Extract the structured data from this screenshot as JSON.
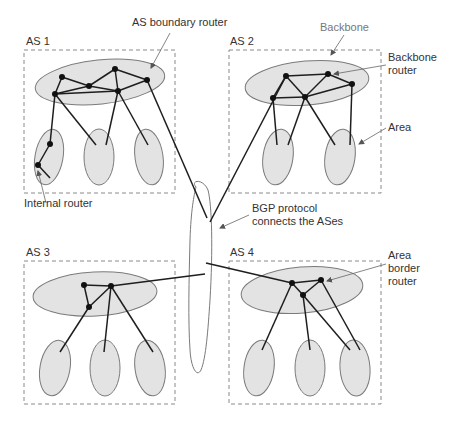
{
  "diagram": {
    "colors": {
      "region_fill": "#e3e3e3",
      "region_stroke": "#7a7a7a",
      "link": "#1e1e1e",
      "router": "#111111",
      "box_dash": "#8a8a8a",
      "label": "#333333",
      "label_light": "#777777",
      "pointer": "#666666"
    },
    "autonomous_systems": [
      {
        "id": "as1",
        "label": "AS 1",
        "box": [
          24,
          50,
          151,
          143
        ],
        "label_pos": [
          26,
          45
        ],
        "backbone": {
          "cx": 100,
          "cy": 82,
          "rx": 65,
          "ry": 22,
          "rot": -6
        },
        "areas": [
          {
            "cx": 49,
            "cy": 157,
            "rx": 14,
            "ry": 28,
            "rot": 10
          },
          {
            "cx": 99,
            "cy": 157,
            "rx": 15,
            "ry": 28,
            "rot": 0
          },
          {
            "cx": 149,
            "cy": 157,
            "rx": 14,
            "ry": 28,
            "rot": -8
          }
        ],
        "routers": [
          [
            62,
            77
          ],
          [
            55,
            94
          ],
          [
            89,
            86
          ],
          [
            115,
            69
          ],
          [
            118,
            91
          ],
          [
            147,
            80
          ],
          [
            50,
            144
          ],
          [
            38,
            165
          ]
        ],
        "links": [
          [
            62,
            77,
            55,
            94
          ],
          [
            62,
            77,
            89,
            86
          ],
          [
            89,
            86,
            115,
            69
          ],
          [
            115,
            69,
            147,
            80
          ],
          [
            55,
            94,
            89,
            86
          ],
          [
            89,
            86,
            118,
            91
          ],
          [
            55,
            94,
            118,
            91
          ],
          [
            118,
            91,
            147,
            80
          ],
          [
            115,
            69,
            118,
            91
          ],
          [
            55,
            94,
            50,
            144
          ],
          [
            50,
            144,
            38,
            165
          ],
          [
            38,
            165,
            50,
            178
          ],
          [
            55,
            94,
            96,
            145
          ],
          [
            118,
            91,
            106,
            145
          ],
          [
            118,
            91,
            148,
            145
          ]
        ]
      },
      {
        "id": "as2",
        "label": "AS 2",
        "box": [
          229,
          50,
          152,
          143
        ],
        "label_pos": [
          230,
          45
        ],
        "backbone": {
          "cx": 307,
          "cy": 83,
          "rx": 62,
          "ry": 22,
          "rot": -5
        },
        "areas": [
          {
            "cx": 278,
            "cy": 157,
            "rx": 15,
            "ry": 28,
            "rot": 8
          },
          {
            "cx": 340,
            "cy": 157,
            "rx": 15,
            "ry": 28,
            "rot": 8
          }
        ],
        "routers": [
          [
            286,
            76
          ],
          [
            328,
            74
          ],
          [
            352,
            84
          ],
          [
            273,
            98
          ],
          [
            305,
            97
          ]
        ],
        "links": [
          [
            286,
            76,
            328,
            74
          ],
          [
            328,
            74,
            352,
            84
          ],
          [
            286,
            76,
            273,
            98
          ],
          [
            286,
            76,
            305,
            97
          ],
          [
            328,
            74,
            305,
            97
          ],
          [
            273,
            98,
            305,
            97
          ],
          [
            305,
            97,
            352,
            84
          ],
          [
            273,
            98,
            277,
            145
          ],
          [
            305,
            97,
            288,
            145
          ],
          [
            305,
            97,
            335,
            145
          ],
          [
            352,
            84,
            350,
            145
          ]
        ]
      },
      {
        "id": "as3",
        "label": "AS 3",
        "box": [
          24,
          261,
          151,
          143
        ],
        "label_pos": [
          26,
          256
        ],
        "backbone": {
          "cx": 95,
          "cy": 294,
          "rx": 62,
          "ry": 22,
          "rot": -3
        },
        "areas": [
          {
            "cx": 55,
            "cy": 368,
            "rx": 15,
            "ry": 28,
            "rot": 10
          },
          {
            "cx": 105,
            "cy": 368,
            "rx": 15,
            "ry": 28,
            "rot": 0
          },
          {
            "cx": 150,
            "cy": 368,
            "rx": 15,
            "ry": 28,
            "rot": -8
          }
        ],
        "routers": [
          [
            84,
            285
          ],
          [
            111,
            286
          ],
          [
            89,
            307
          ]
        ],
        "links": [
          [
            84,
            285,
            111,
            286
          ],
          [
            84,
            285,
            89,
            307
          ],
          [
            89,
            307,
            111,
            286
          ],
          [
            89,
            307,
            60,
            352
          ],
          [
            111,
            286,
            104,
            352
          ],
          [
            111,
            286,
            153,
            352
          ]
        ]
      },
      {
        "id": "as4",
        "label": "AS 4",
        "box": [
          229,
          261,
          152,
          143
        ],
        "label_pos": [
          230,
          256
        ],
        "backbone": {
          "cx": 302,
          "cy": 290,
          "rx": 61,
          "ry": 23,
          "rot": -5
        },
        "areas": [
          {
            "cx": 259,
            "cy": 368,
            "rx": 15,
            "ry": 28,
            "rot": 8
          },
          {
            "cx": 310,
            "cy": 368,
            "rx": 15,
            "ry": 28,
            "rot": 0
          },
          {
            "cx": 355,
            "cy": 368,
            "rx": 15,
            "ry": 28,
            "rot": -4
          }
        ],
        "routers": [
          [
            292,
            283
          ],
          [
            321,
            280
          ],
          [
            303,
            295
          ]
        ],
        "links": [
          [
            292,
            283,
            321,
            280
          ],
          [
            292,
            283,
            303,
            295
          ],
          [
            303,
            295,
            321,
            280
          ],
          [
            292,
            283,
            262,
            350
          ],
          [
            303,
            295,
            310,
            350
          ],
          [
            303,
            295,
            350,
            350
          ],
          [
            321,
            280,
            360,
            350
          ]
        ]
      }
    ],
    "bgp_links": [
      [
        147,
        80,
        207,
        218
      ],
      [
        286,
        76,
        210,
        222
      ],
      [
        111,
        286,
        205,
        274
      ],
      [
        206,
        263,
        292,
        283
      ]
    ],
    "bgp_cloud_path": "M196,187 C190,180 203,178 208,190 C212,205 213,250 210,300 C208,330 206,358 201,370 C197,378 191,368 190,350 C188,320 189,280 190,240 C191,210 194,195 196,187 Z",
    "labels": [
      {
        "id": "as-boundary-router-label",
        "text": "AS boundary router",
        "x": 132,
        "y": 26,
        "cls": ""
      },
      {
        "id": "backbone-label",
        "text": "Backbone",
        "x": 320,
        "y": 31,
        "cls": "light"
      },
      {
        "id": "backbone-router-label-1",
        "text": "Backbone",
        "x": 388,
        "y": 61,
        "cls": ""
      },
      {
        "id": "backbone-router-label-2",
        "text": "router",
        "x": 388,
        "y": 74,
        "cls": ""
      },
      {
        "id": "area-label",
        "text": "Area",
        "x": 388,
        "y": 131,
        "cls": ""
      },
      {
        "id": "internal-router-label",
        "text": "Internal router",
        "x": 24,
        "y": 207,
        "cls": ""
      },
      {
        "id": "bgp-label-1",
        "text": "BGP protocol",
        "x": 252,
        "y": 212,
        "cls": ""
      },
      {
        "id": "bgp-label-2",
        "text": "connects the ASes",
        "x": 252,
        "y": 225,
        "cls": ""
      },
      {
        "id": "area-border-router-label-1",
        "text": "Area",
        "x": 388,
        "y": 259,
        "cls": ""
      },
      {
        "id": "area-border-router-label-2",
        "text": "border",
        "x": 388,
        "y": 272,
        "cls": ""
      },
      {
        "id": "area-border-router-label-3",
        "text": "router",
        "x": 388,
        "y": 285,
        "cls": ""
      }
    ],
    "pointers": [
      [
        170,
        33,
        151,
        68
      ],
      [
        344,
        35,
        331,
        55
      ],
      [
        386,
        65,
        334,
        74
      ],
      [
        386,
        128,
        359,
        144
      ],
      [
        46,
        203,
        38,
        171
      ],
      [
        249,
        215,
        220,
        228
      ],
      [
        386,
        264,
        327,
        281
      ]
    ]
  }
}
